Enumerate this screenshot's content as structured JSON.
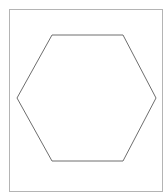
{
  "canvas": {
    "width": 167,
    "height": 196,
    "background": "#ffffff"
  },
  "frame": {
    "x": 9,
    "y": 9,
    "width": 153,
    "height": 182,
    "stroke": "#b4b4b4",
    "stroke_width": 1
  },
  "shape": {
    "type": "hexagon",
    "stroke": "#6e6e6e",
    "stroke_width": 1,
    "fill": "none",
    "points": [
      [
        52,
        35
      ],
      [
        123,
        35
      ],
      [
        156,
        98
      ],
      [
        123,
        161
      ],
      [
        52,
        161
      ],
      [
        17,
        98
      ]
    ]
  }
}
